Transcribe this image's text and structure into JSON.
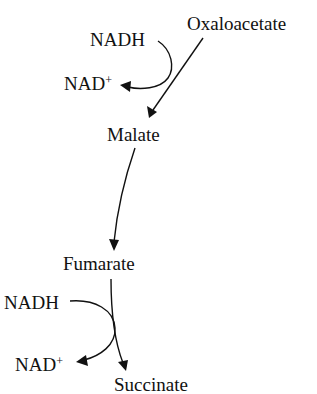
{
  "diagram": {
    "type": "metabolic-pathway",
    "nodes": {
      "oxaloacetate": "Oxaloacetate",
      "malate": "Malate",
      "fumarate": "Fumarate",
      "succinate": "Succinate"
    },
    "cofactors": {
      "step1_in": "NADH",
      "step1_out_base": "NAD",
      "step1_out_sup": "+",
      "step2_in": "NADH",
      "step2_out_base": "NAD",
      "step2_out_sup": "+"
    },
    "edges": [
      {
        "from": "Oxaloacetate",
        "to": "Malate",
        "cofactor_in": "NADH",
        "cofactor_out": "NAD+"
      },
      {
        "from": "Malate",
        "to": "Fumarate"
      },
      {
        "from": "Fumarate",
        "to": "Succinate",
        "cofactor_in": "NADH",
        "cofactor_out": "NAD+"
      }
    ],
    "colors": {
      "ink": "#111111",
      "background": "#ffffff"
    }
  }
}
